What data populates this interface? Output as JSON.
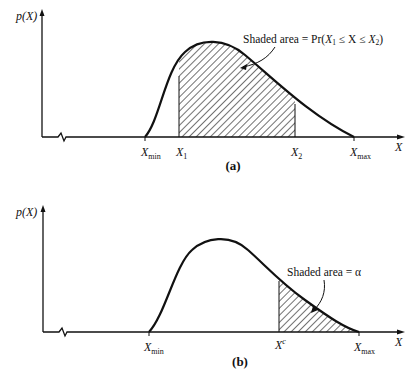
{
  "panels": [
    {
      "id": "a",
      "caption": "(a)",
      "y_axis_label": "p(X)",
      "x_axis_label": "X",
      "ticks": {
        "x_min": {
          "main": "X",
          "sub": "min"
        },
        "x1": {
          "main": "X",
          "sub": "1"
        },
        "x2": {
          "main": "X",
          "sub": "2"
        },
        "x_max": {
          "main": "X",
          "sub": "max"
        }
      },
      "annotation": {
        "prefix": "Shaded area = Pr(",
        "x1_main": "X",
        "x1_sub": "1",
        "middle": " ≤ X ≤ ",
        "x2_main": "X",
        "x2_sub": "2",
        "suffix": ")"
      }
    },
    {
      "id": "b",
      "caption": "(b)",
      "y_axis_label": "p(X)",
      "x_axis_label": "X",
      "ticks": {
        "x_min": {
          "main": "X",
          "sub": "min"
        },
        "x_c": {
          "main": "X",
          "sup": "c"
        },
        "x_max": {
          "main": "X",
          "sub": "max"
        }
      },
      "annotation": {
        "text": "Shaded area = α"
      }
    }
  ],
  "colors": {
    "ink": "#111111",
    "background": "#ffffff"
  }
}
